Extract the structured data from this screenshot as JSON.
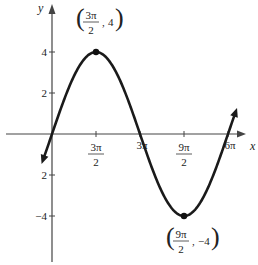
{
  "chart_data": {
    "type": "line",
    "title": "",
    "function": "y = 4 sin(x/3)",
    "xlabel": "x",
    "ylabel": "y",
    "x_ticks": [
      {
        "num": "3π",
        "den": "2",
        "value": 4.712
      },
      {
        "num": "3π",
        "den": "",
        "value": 9.425
      },
      {
        "num": "9π",
        "den": "2",
        "value": 14.137
      },
      {
        "num": "6π",
        "den": "",
        "value": 18.85
      }
    ],
    "y_ticks": [
      {
        "label": "4",
        "value": 4
      },
      {
        "label": "2",
        "value": 2
      },
      {
        "label": "2",
        "value": -2
      },
      {
        "label": "−4",
        "value": -4
      }
    ],
    "xlim": [
      -1.2,
      20.5
    ],
    "ylim": [
      -6.2,
      6.3
    ],
    "grid": false,
    "annotations": [
      {
        "point": [
          4.712,
          4
        ],
        "label_num": "3π",
        "label_den": "2",
        "label_y": "4"
      },
      {
        "point": [
          14.137,
          -4
        ],
        "label_num": "9π",
        "label_den": "2",
        "label_y": "−4"
      }
    ],
    "series": [
      {
        "name": "curve",
        "x_range": [
          -0.9,
          19.6
        ],
        "color": "#1a1a1a"
      }
    ]
  }
}
